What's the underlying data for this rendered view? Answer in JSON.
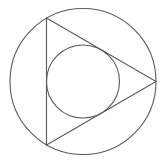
{
  "diagram": {
    "title": "",
    "width": 163,
    "height": 162,
    "background": "#ffffff",
    "stroke_color": "#5a5a5a",
    "stroke_width": 1.1,
    "shapes": {
      "circumcircle": {
        "cx": 83,
        "cy": 81.5,
        "r": 73
      },
      "triangle": {
        "vertices": [
          {
            "x": 46.5,
            "y": 18
          },
          {
            "x": 156,
            "y": 81.5
          },
          {
            "x": 46.5,
            "y": 145
          }
        ]
      },
      "incircle": {
        "cx": 83,
        "cy": 81.5,
        "r": 36.5
      }
    }
  }
}
